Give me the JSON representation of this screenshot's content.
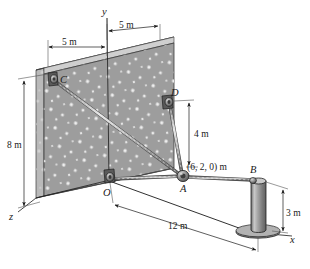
{
  "figure": {
    "axes": {
      "y_label": "y",
      "z_label": "z",
      "x_label": "x"
    },
    "points": {
      "c_label": "C",
      "d_label": "D",
      "o_label": "O",
      "a_label": "A",
      "b_label": "B"
    },
    "annotations": {
      "a_coordinates": "(6, 2, 0) m"
    },
    "dimensions": {
      "wall_left_span": "5 m",
      "wall_right_span": "5 m",
      "wall_height": "8 m",
      "d_to_a_height": "4 m",
      "post_height": "3 m",
      "o_to_post_distance": "12 m"
    },
    "colors": {
      "wall_face": "#9a9a9a",
      "wall_top": "#d3d3d3",
      "wall_edge": "#bdbdbd",
      "speckle": "#efefef",
      "cable": "#b5b5b5",
      "post": "#8c8c8c",
      "outline": "#1a1a1a"
    }
  }
}
